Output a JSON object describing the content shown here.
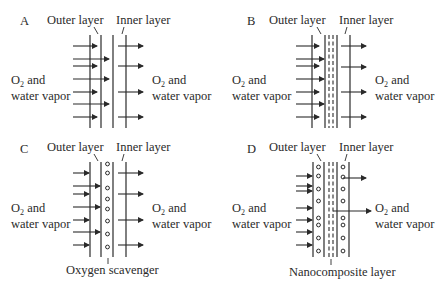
{
  "figure": {
    "panels": [
      {
        "id": "A",
        "letter": "A",
        "outer_label": "Outer layer",
        "inner_label": "Inner layer",
        "left_gas_line1": "O",
        "left_gas_sub": "2",
        "left_gas_rest": " and",
        "left_gas_line2": "water vapor",
        "right_gas_line1": "O",
        "right_gas_sub": "2",
        "right_gas_rest": " and",
        "right_gas_line2": "water vapor",
        "bottom_label": ""
      },
      {
        "id": "B",
        "letter": "B",
        "outer_label": "Outer layer",
        "inner_label": "Inner layer",
        "left_gas_line1": "O",
        "left_gas_sub": "2",
        "left_gas_rest": " and",
        "left_gas_line2": "water vapor",
        "right_gas_line1": "O",
        "right_gas_sub": "2",
        "right_gas_rest": " and",
        "right_gas_line2": "water vapor",
        "bottom_label": ""
      },
      {
        "id": "C",
        "letter": "C",
        "outer_label": "Outer layer",
        "inner_label": "Inner layer",
        "left_gas_line1": "O",
        "left_gas_sub": "2",
        "left_gas_rest": " and",
        "left_gas_line2": "water vapor",
        "right_gas_line1": "O",
        "right_gas_sub": "2",
        "right_gas_rest": " and",
        "right_gas_line2": "water vapor",
        "bottom_label": "Oxygen scavenger"
      },
      {
        "id": "D",
        "letter": "D",
        "outer_label": "Outer layer",
        "inner_label": "Inner layer",
        "left_gas_line1": "O",
        "left_gas_sub": "2",
        "left_gas_rest": " and",
        "left_gas_line2": "water vapor",
        "right_gas_line1": "O",
        "right_gas_sub": "2",
        "right_gas_rest": " and",
        "right_gas_line2": "water vapor",
        "bottom_label": "Nanocomposite layer"
      }
    ]
  }
}
